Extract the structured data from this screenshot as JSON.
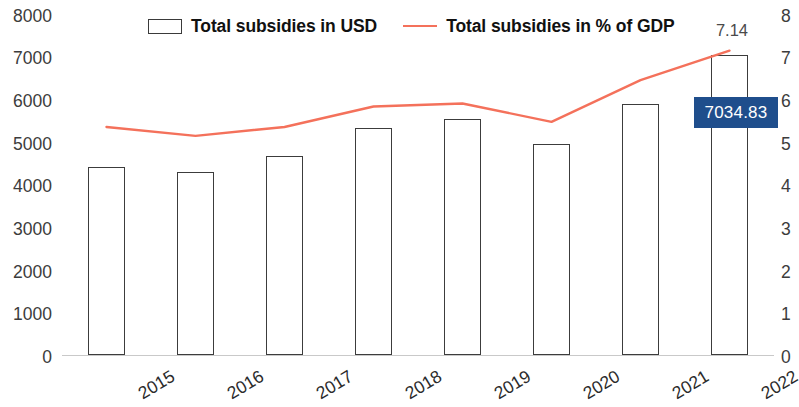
{
  "chart": {
    "legend": [
      {
        "name": "bars",
        "label": "Total subsidies in USD",
        "marker": "bar-swatch-icon",
        "color": "#FFFFFF",
        "outline": "#3A3A3A"
      },
      {
        "name": "line",
        "label": "Total subsidies in % of GDP",
        "marker": "line-swatch-icon",
        "color": "#F4715B"
      }
    ],
    "y_left_ticks": [
      "8000",
      "7000",
      "6000",
      "5000",
      "4000",
      "3000",
      "2000",
      "1000",
      "0"
    ],
    "y_right_ticks": [
      "8",
      "7",
      "6",
      "5",
      "4",
      "3",
      "2",
      "1",
      "0"
    ],
    "x_ticks": [
      "2015",
      "2016",
      "2017",
      "2018",
      "2019",
      "2020",
      "2021",
      "2022"
    ],
    "annotations": {
      "peak_pct": "7.14",
      "callout_value": "7034.83",
      "callout_bg": "#1F4E8C",
      "callout_fg": "#FFFFFF"
    }
  },
  "chart_data": {
    "type": "bar",
    "title": "",
    "subtitle": "",
    "xlabel": "",
    "ylabel": "",
    "grid": false,
    "legend_position": "top-center",
    "categories": [
      "2015",
      "2016",
      "2017",
      "2018",
      "2019",
      "2020",
      "2021",
      "2022"
    ],
    "axes": {
      "left": {
        "label": "Total subsidies in USD",
        "min": 0,
        "max": 8000,
        "step": 1000
      },
      "right": {
        "label": "Total subsidies in % of GDP",
        "min": 0,
        "max": 8,
        "step": 1
      }
    },
    "series": [
      {
        "name": "Total subsidies in USD",
        "type": "bar",
        "axis": "left",
        "color": "#FFFFFF",
        "outline": "#3A3A3A",
        "values": [
          4400,
          4300,
          4680,
          5320,
          5530,
          4960,
          5880,
          7034.83
        ]
      },
      {
        "name": "Total subsidies in % of GDP",
        "type": "line",
        "axis": "right",
        "color": "#F4715B",
        "values": [
          5.35,
          5.14,
          5.35,
          5.83,
          5.9,
          5.47,
          6.45,
          7.14
        ]
      }
    ],
    "annotations": [
      {
        "text": "7.14",
        "series": "Total subsidies in % of GDP",
        "category": "2022"
      },
      {
        "text": "7034.83",
        "series": "Total subsidies in USD",
        "category": "2022"
      }
    ]
  }
}
